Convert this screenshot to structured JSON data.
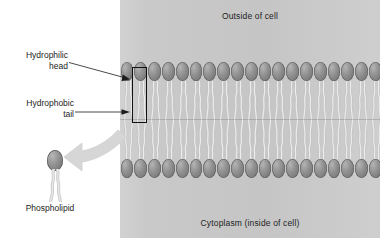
{
  "diagram": {
    "panel": {
      "outside_label": "Outside of cell",
      "inside_label": "Cytoplasm (inside of cell)",
      "background_color": "#c9c9c9"
    },
    "labels": {
      "hydrophilic_head": "Hydrophilic\nhead",
      "hydrophilic_head_line1": "Hydrophilic",
      "hydrophilic_head_line2": "head",
      "hydrophobic_tail_line1": "Hydrophobic",
      "hydrophobic_tail_line2": "tail",
      "phospholipid": "Phospholipid"
    },
    "membrane": {
      "lipid_count_per_leaflet": 19,
      "leaflets": 2,
      "head_color": "#8a8a8a",
      "tail_color": "#d8d8d8",
      "highlight_box_color": "#111111",
      "highlighted_lipid_index": 1
    },
    "callout_arrow": {
      "name": "magnify-arrow",
      "direction": "membrane-to-molecule",
      "color": "#d4d4d4"
    }
  }
}
